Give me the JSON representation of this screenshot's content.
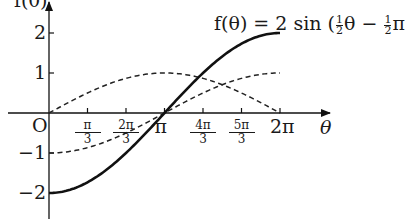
{
  "chart_data": {
    "type": "line",
    "title_parts": {
      "prefix": "f(θ) = 2 sin (",
      "frac1_num": "1",
      "frac1_den": "2",
      "mid": "θ − ",
      "frac2_num": "1",
      "frac2_den": "2",
      "suffix": "π"
    },
    "xlabel": "θ",
    "ylabel": "f(θ)",
    "origin_label": "O",
    "xlim": [
      0,
      6.2832
    ],
    "ylim": [
      -2.5,
      2.5
    ],
    "x_ticks": [
      {
        "value": 1.0472,
        "num": "π",
        "den": "3"
      },
      {
        "value": 2.0944,
        "num": "2π",
        "den": "3"
      },
      {
        "value": 3.1416,
        "label": "π"
      },
      {
        "value": 4.1888,
        "num": "4π",
        "den": "3"
      },
      {
        "value": 5.236,
        "num": "5π",
        "den": "3"
      },
      {
        "value": 6.2832,
        "label": "2π"
      }
    ],
    "y_ticks": [
      {
        "value": 2,
        "label": "2"
      },
      {
        "value": 1,
        "label": "1"
      },
      {
        "value": -1,
        "label": "−1"
      },
      {
        "value": -2,
        "label": "−2"
      }
    ],
    "x": [
      0,
      1.0472,
      2.0944,
      3.1416,
      4.1888,
      5.236,
      6.2832
    ],
    "series": [
      {
        "name": "f(θ) = 2 sin(½θ − ½π)",
        "style": "solid",
        "values": [
          -2,
          -1.732,
          -1,
          0,
          1,
          1.732,
          2
        ]
      },
      {
        "name": "sin(½θ)",
        "style": "dashed",
        "values": [
          0,
          0.5,
          0.866,
          1,
          0.866,
          0.5,
          0
        ]
      },
      {
        "name": "−cos(½θ)",
        "style": "dashed",
        "values": [
          -1,
          -0.866,
          -0.5,
          0,
          0.5,
          0.866,
          1
        ]
      }
    ],
    "grid": false,
    "legend": "none"
  }
}
